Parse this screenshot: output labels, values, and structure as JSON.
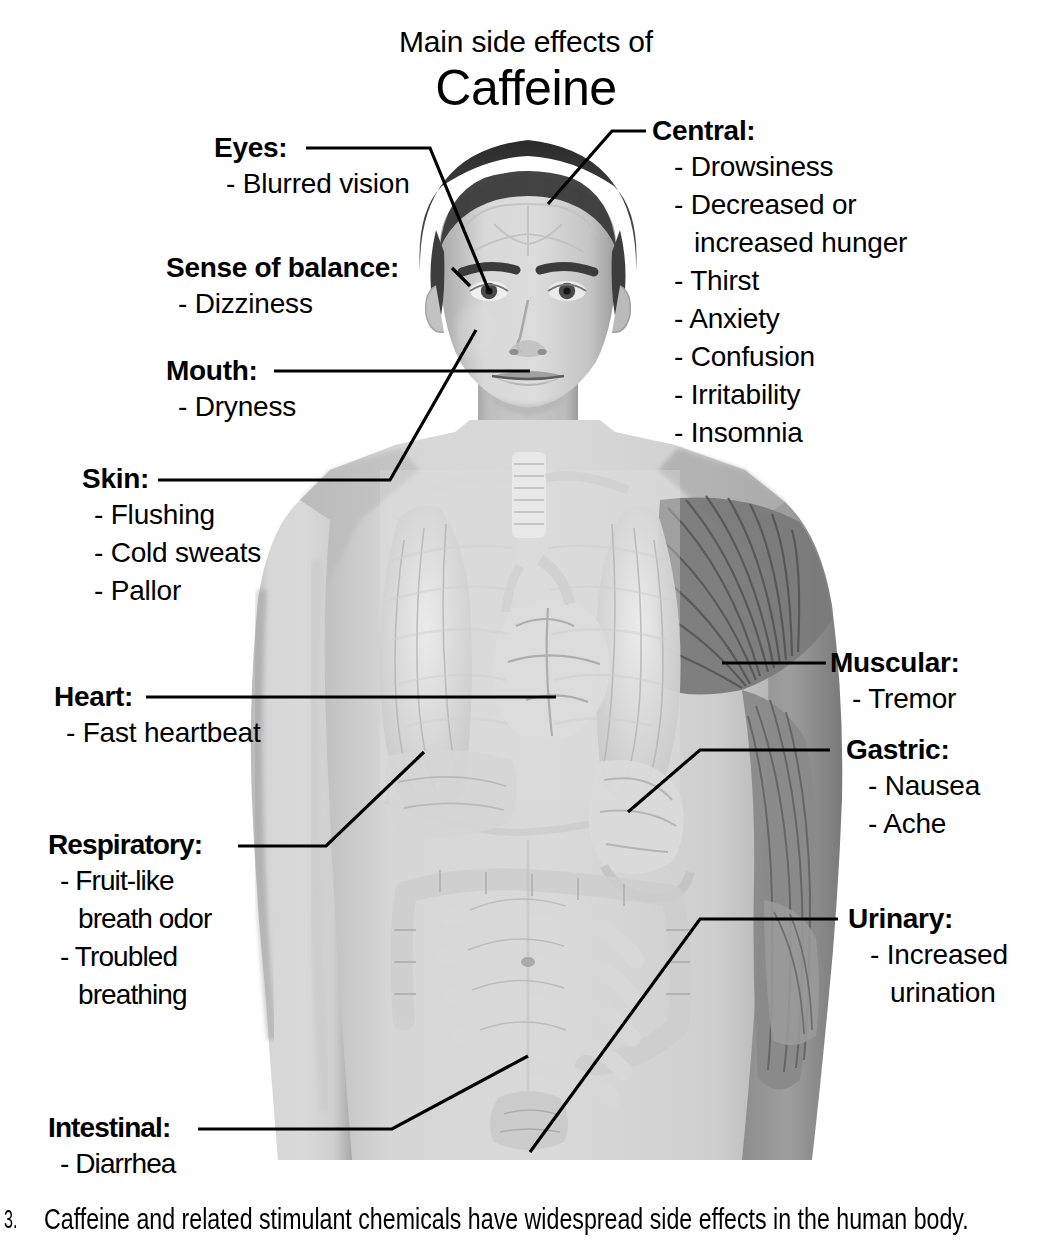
{
  "title": {
    "kicker": "Main side effects of",
    "main": "Caffeine"
  },
  "labels": {
    "eyes": {
      "head": "Eyes:",
      "items": [
        "- Blurred vision"
      ]
    },
    "balance": {
      "head": "Sense of balance:",
      "items": [
        "- Dizziness"
      ]
    },
    "mouth": {
      "head": "Mouth:",
      "items": [
        "- Dryness"
      ]
    },
    "skin": {
      "head": "Skin:",
      "items": [
        "- Flushing",
        "- Cold sweats",
        "- Pallor"
      ]
    },
    "heart": {
      "head": "Heart:",
      "items": [
        "- Fast heartbeat"
      ]
    },
    "respiratory": {
      "head": "Respiratory:",
      "items": [
        "- Fruit-like",
        "breath odor",
        "- Troubled",
        "breathing"
      ]
    },
    "intestinal": {
      "head": "Intestinal:",
      "items": [
        "- Diarrhea"
      ]
    },
    "central": {
      "head": "Central:",
      "items": [
        "- Drowsiness",
        "- Decreased or",
        "increased hunger",
        "- Thirst",
        "- Anxiety",
        "- Confusion",
        "- Irritability",
        "- Insomnia"
      ]
    },
    "muscular": {
      "head": "Muscular:",
      "items": [
        "- Tremor"
      ]
    },
    "gastric": {
      "head": "Gastric:",
      "items": [
        "- Nausea",
        "- Ache"
      ]
    },
    "urinary": {
      "head": "Urinary:",
      "items": [
        "- Increased",
        "urination"
      ]
    }
  },
  "caption": {
    "number": "3.",
    "text": "Caffeine and related stimulant chemicals have widespread side effects in the human body."
  },
  "colors": {
    "ink": "#000000",
    "background": "#ffffff",
    "skin_light": "#d3d3d3",
    "skin_mid": "#b6b6b6",
    "organ_light": "#e3e3e3",
    "muscle_dark": "#6f6f6f"
  },
  "figure": {
    "regions": [
      "head",
      "brain",
      "eyes",
      "mouth",
      "neck",
      "trachea",
      "lungs",
      "heart",
      "liver",
      "stomach",
      "small-intestine",
      "large-intestine",
      "bladder",
      "shoulder-muscle",
      "arm-muscle"
    ]
  }
}
